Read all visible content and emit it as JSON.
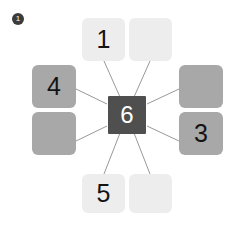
{
  "canvas": {
    "width": 241,
    "height": 225,
    "background": "#ffffff"
  },
  "badge": {
    "label": "1",
    "shape": "filled-circle",
    "color": "#3c3c3c",
    "text_color": "#ffffff",
    "x": 12,
    "y": 13,
    "size": 12
  },
  "diagram": {
    "title": "",
    "hub": {
      "label": "6",
      "color": "#4f4f4f",
      "text_color": "#ffffff",
      "x": 108,
      "y": 96,
      "width": 38,
      "height": 38
    },
    "connector_color": "#8c8c8c",
    "connector_width": 0.9,
    "tiles": [
      {
        "id": "tile-top-left",
        "label": "1",
        "tone": "light",
        "color": "#ededed",
        "x": 82,
        "y": 18,
        "width": 43,
        "height": 43
      },
      {
        "id": "tile-top-right",
        "label": "",
        "tone": "light",
        "color": "#ededed",
        "x": 129,
        "y": 18,
        "width": 43,
        "height": 43
      },
      {
        "id": "tile-left-top",
        "label": "4",
        "tone": "mid",
        "color": "#a8a8a8",
        "x": 32,
        "y": 65,
        "width": 44,
        "height": 43
      },
      {
        "id": "tile-left-bottom",
        "label": "",
        "tone": "mid",
        "color": "#a8a8a8",
        "x": 32,
        "y": 112,
        "width": 44,
        "height": 43
      },
      {
        "id": "tile-right-top",
        "label": "",
        "tone": "mid",
        "color": "#a8a8a8",
        "x": 179,
        "y": 65,
        "width": 44,
        "height": 43
      },
      {
        "id": "tile-right-bottom",
        "label": "3",
        "tone": "mid",
        "color": "#a8a8a8",
        "x": 179,
        "y": 112,
        "width": 44,
        "height": 43
      },
      {
        "id": "tile-bottom-left",
        "label": "5",
        "tone": "light",
        "color": "#ededed",
        "x": 82,
        "y": 174,
        "width": 43,
        "height": 39
      },
      {
        "id": "tile-bottom-right",
        "label": "",
        "tone": "light",
        "color": "#ededed",
        "x": 129,
        "y": 174,
        "width": 43,
        "height": 39
      }
    ],
    "connectors": [
      {
        "id": "hub-to-top-left",
        "x1": 120,
        "y1": 97,
        "x2": 104,
        "y2": 61
      },
      {
        "id": "hub-to-top-right",
        "x1": 134,
        "y1": 97,
        "x2": 150,
        "y2": 61
      },
      {
        "id": "hub-to-left-top",
        "x1": 107,
        "y1": 104,
        "x2": 76,
        "y2": 89
      },
      {
        "id": "hub-to-left-bottom",
        "x1": 107,
        "y1": 126,
        "x2": 76,
        "y2": 141
      },
      {
        "id": "hub-to-right-top",
        "x1": 147,
        "y1": 104,
        "x2": 179,
        "y2": 89
      },
      {
        "id": "hub-to-right-bottom",
        "x1": 147,
        "y1": 126,
        "x2": 179,
        "y2": 141
      },
      {
        "id": "hub-to-bottom-left",
        "x1": 120,
        "y1": 133,
        "x2": 104,
        "y2": 174
      },
      {
        "id": "hub-to-bottom-right",
        "x1": 134,
        "y1": 133,
        "x2": 150,
        "y2": 174
      }
    ]
  }
}
